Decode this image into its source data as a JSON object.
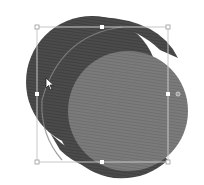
{
  "canvas": {
    "background": "#ffffff",
    "width": 204,
    "height": 185
  },
  "shape": {
    "type": "cylinder",
    "name": "3D cylinder shape",
    "side_color": "#4a4a4a",
    "back_color": "#555555",
    "front_color": "#7a7a7a",
    "stripe_color": "#6e6e6e",
    "edge_line_color": "#8a8a8a"
  },
  "selection": {
    "box_color": "#b0b0b0",
    "handle_fill": "#ffffff",
    "handle_stroke": "#999999",
    "bounds": {
      "x": 37,
      "y": 27,
      "width": 131,
      "height": 135
    },
    "handles": [
      "top-left",
      "top-middle",
      "top-right",
      "middle-left",
      "middle-right",
      "bottom-left",
      "bottom-middle",
      "bottom-right"
    ],
    "rotation_handle": "rotate"
  },
  "cursor": {
    "type": "arrow",
    "x": 46,
    "y": 80
  }
}
